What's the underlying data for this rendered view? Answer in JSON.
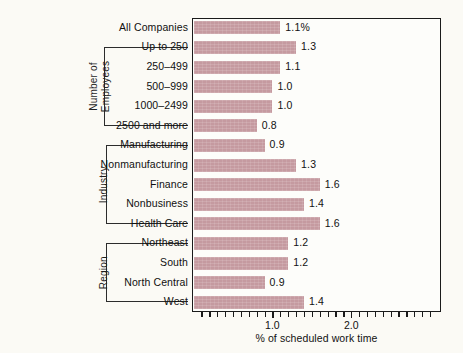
{
  "chart_data": {
    "type": "bar",
    "orientation": "horizontal",
    "title": "",
    "xlabel": "% of scheduled work time",
    "ylabel": "",
    "xlim": [
      0,
      3.0
    ],
    "xticks": [
      1.0,
      2.0
    ],
    "xtick_labels": [
      "1.0",
      "2.0"
    ],
    "minor_tick_step": 0.1,
    "grid": false,
    "legend": false,
    "bar_color": "#c59aa0",
    "categories": [
      "All Companies",
      "Up to 250",
      "250–499",
      "500–999",
      "1000–2499",
      "2500 and more",
      "Manufacturing",
      "Nonmanufacturing",
      "Finance",
      "Nonbusiness",
      "Health Care",
      "Northeast",
      "South",
      "North Central",
      "West"
    ],
    "values": [
      1.1,
      1.3,
      1.1,
      1.0,
      1.0,
      0.8,
      0.9,
      1.3,
      1.6,
      1.4,
      1.6,
      1.2,
      1.2,
      0.9,
      1.4
    ],
    "value_labels": [
      "1.1%",
      "1.3",
      "1.1",
      "1.0",
      "1.0",
      "0.8",
      "0.9",
      "1.3",
      "1.6",
      "1.4",
      "1.6",
      "1.2",
      "1.2",
      "0.9",
      "1.4"
    ],
    "groups": [
      {
        "label_line1": "Number of",
        "label_line2": "Employees",
        "first_index": 1,
        "last_index": 5
      },
      {
        "label_line1": "Industry",
        "label_line2": "",
        "first_index": 6,
        "last_index": 10
      },
      {
        "label_line1": "Region",
        "label_line2": "",
        "first_index": 11,
        "last_index": 14
      }
    ]
  }
}
